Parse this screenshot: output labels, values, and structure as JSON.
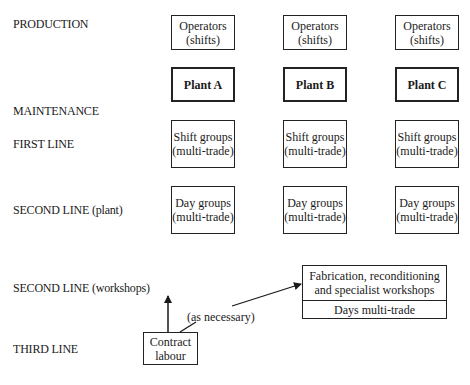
{
  "row_labels": {
    "production": "PRODUCTION",
    "maintenance": "MAINTENANCE",
    "first_line": "FIRST LINE",
    "second_line_plant": "SECOND LINE (plant)",
    "second_line_workshops": "SECOND LINE (workshops)",
    "third_line": "THIRD LINE"
  },
  "columns": [
    {
      "operators": {
        "line1": "Operators",
        "line2": "(shifts)"
      },
      "plant": "Plant A",
      "first_line": {
        "line1": "Shift groups",
        "line2": "(multi-trade)"
      },
      "second_line": {
        "line1": "Day groups",
        "line2": "(multi-trade)"
      }
    },
    {
      "operators": {
        "line1": "Operators",
        "line2": "(shifts)"
      },
      "plant": "Plant B",
      "first_line": {
        "line1": "Shift groups",
        "line2": "(multi-trade)"
      },
      "second_line": {
        "line1": "Day groups",
        "line2": "(multi-trade)"
      }
    },
    {
      "operators": {
        "line1": "Operators",
        "line2": "(shifts)"
      },
      "plant": "Plant C",
      "first_line": {
        "line1": "Shift groups",
        "line2": "(multi-trade)"
      },
      "second_line": {
        "line1": "Day groups",
        "line2": "(multi-trade)"
      }
    }
  ],
  "workshops": {
    "line1": "Fabrication, reconditioning",
    "line2": "and specialist workshops",
    "sub": "Days multi-trade"
  },
  "contract_labour": {
    "line1": "Contract",
    "line2": "labour"
  },
  "arrow_note": "(as necessary)"
}
